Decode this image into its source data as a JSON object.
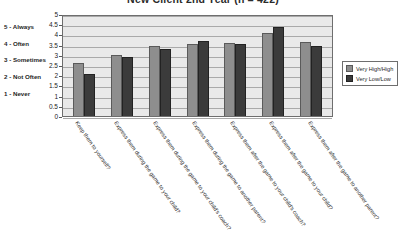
{
  "chart_data": {
    "type": "bar",
    "title": "New Client 2nd Year (n = 422)",
    "xlabel": "",
    "ylabel": "",
    "ylim": [
      0,
      5
    ],
    "grid": true,
    "legend_position": "right",
    "yticks": [
      "0",
      "0.5",
      "1",
      "1.5",
      "2",
      "2.5",
      "3",
      "3.5",
      "4",
      "4.5",
      "5"
    ],
    "ytick_values": [
      0,
      0.5,
      1,
      1.5,
      2,
      2.5,
      3,
      3.5,
      4,
      4.5,
      5
    ],
    "scale_key": [
      "5 - Always",
      "4 - Often",
      "3 - Sometimes",
      "2 - Not Often",
      "1 - Never"
    ],
    "categories": [
      "Keep them to yourself?",
      "Express them during the game to your child?",
      "Express them during the game to your child's coach?",
      "Express them during the game to another parent?",
      "Express them after the game to your child's coach?",
      "Express them after the game to your child?",
      "Express them after the game to another parent?"
    ],
    "series": [
      {
        "name": "Very High/High",
        "color": "#8e8e8e",
        "values": [
          2.58,
          3.0,
          3.43,
          3.54,
          3.58,
          4.05,
          3.61
        ]
      },
      {
        "name": "Very Low/Low",
        "color": "#3b3b3b",
        "values": [
          2.08,
          2.88,
          3.28,
          3.67,
          3.53,
          4.38,
          3.41
        ]
      }
    ]
  }
}
